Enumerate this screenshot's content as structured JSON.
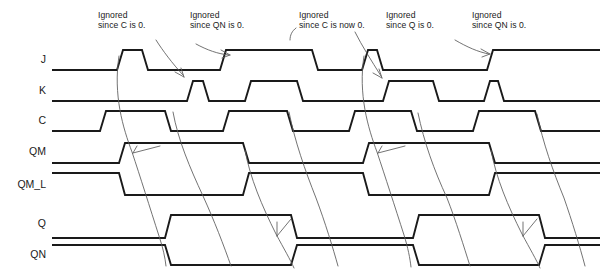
{
  "figure": {
    "type": "digital-timing-diagram",
    "title": "",
    "width": 604,
    "height": 272,
    "background_color": "#ffffff",
    "wave_color": "#1a1a1a",
    "leader_color": "#5a5a5a"
  },
  "signals": [
    {
      "name": "J",
      "label": "J"
    },
    {
      "name": "K",
      "label": "K"
    },
    {
      "name": "C",
      "label": "C"
    },
    {
      "name": "QM",
      "label": "QM"
    },
    {
      "name": "QM_L",
      "label": "QM_L"
    },
    {
      "name": "Q",
      "label": "Q"
    },
    {
      "name": "QN",
      "label": "QN"
    }
  ],
  "annotations": [
    {
      "name": "annotation-1",
      "line1": "Ignored",
      "line2": "since C is 0."
    },
    {
      "name": "annotation-2",
      "line1": "Ignored",
      "line2": "since QN is 0."
    },
    {
      "name": "annotation-3",
      "line1": "Ignored",
      "line2": "since C is now 0."
    },
    {
      "name": "annotation-4",
      "line1": "Ignored",
      "line2": "since Q is 0."
    },
    {
      "name": "annotation-5",
      "line1": "Ignored",
      "line2": "since QN is 0."
    }
  ],
  "chart_data": {
    "type": "line",
    "subtype": "timing-waveform",
    "xlabel": "time",
    "ylabel": "logic level",
    "xlim": [
      52,
      600
    ],
    "levels": {
      "low": 0,
      "high": 1
    },
    "series": [
      {
        "name": "J",
        "row_y_low": 70,
        "row_y_high": 50,
        "transitions": [
          {
            "x": 52,
            "level": 0
          },
          {
            "x": 120,
            "level": 1
          },
          {
            "x": 145,
            "level": 0
          },
          {
            "x": 223,
            "level": 1
          },
          {
            "x": 315,
            "level": 0
          },
          {
            "x": 365,
            "level": 1
          },
          {
            "x": 380,
            "level": 0
          },
          {
            "x": 490,
            "level": 1
          },
          {
            "x": 600,
            "level": 1
          }
        ]
      },
      {
        "name": "K",
        "row_y_low": 101,
        "row_y_high": 81,
        "transitions": [
          {
            "x": 52,
            "level": 0
          },
          {
            "x": 190,
            "level": 1
          },
          {
            "x": 206,
            "level": 0
          },
          {
            "x": 248,
            "level": 1
          },
          {
            "x": 300,
            "level": 0
          },
          {
            "x": 386,
            "level": 1
          },
          {
            "x": 436,
            "level": 0
          },
          {
            "x": 487,
            "level": 1
          },
          {
            "x": 501,
            "level": 0
          },
          {
            "x": 600,
            "level": 0
          }
        ]
      },
      {
        "name": "C",
        "row_y_low": 131,
        "row_y_high": 111,
        "transitions": [
          {
            "x": 52,
            "level": 0
          },
          {
            "x": 103,
            "level": 1
          },
          {
            "x": 168,
            "level": 0
          },
          {
            "x": 226,
            "level": 1
          },
          {
            "x": 290,
            "level": 0
          },
          {
            "x": 352,
            "level": 1
          },
          {
            "x": 414,
            "level": 0
          },
          {
            "x": 476,
            "level": 1
          },
          {
            "x": 538,
            "level": 0
          },
          {
            "x": 600,
            "level": 0
          }
        ]
      },
      {
        "name": "QM",
        "row_y_low": 163,
        "row_y_high": 143,
        "transitions": [
          {
            "x": 52,
            "level": 0
          },
          {
            "x": 122,
            "level": 1
          },
          {
            "x": 246,
            "level": 0
          },
          {
            "x": 366,
            "level": 1
          },
          {
            "x": 492,
            "level": 0
          },
          {
            "x": 600,
            "level": 0
          }
        ]
      },
      {
        "name": "QM_L",
        "row_y_low": 195,
        "row_y_high": 173,
        "transitions": [
          {
            "x": 52,
            "level": 1
          },
          {
            "x": 122,
            "level": 0
          },
          {
            "x": 246,
            "level": 1
          },
          {
            "x": 366,
            "level": 0
          },
          {
            "x": 492,
            "level": 1
          },
          {
            "x": 600,
            "level": 1
          }
        ]
      },
      {
        "name": "Q",
        "row_y_low": 238,
        "row_y_high": 215,
        "transitions": [
          {
            "x": 52,
            "level": 0
          },
          {
            "x": 168,
            "level": 1
          },
          {
            "x": 294,
            "level": 0
          },
          {
            "x": 416,
            "level": 1
          },
          {
            "x": 542,
            "level": 0
          },
          {
            "x": 600,
            "level": 0
          }
        ]
      },
      {
        "name": "QN",
        "row_y_low": 265,
        "row_y_high": 245,
        "transitions": [
          {
            "x": 52,
            "level": 1
          },
          {
            "x": 168,
            "level": 0
          },
          {
            "x": 294,
            "level": 1
          },
          {
            "x": 416,
            "level": 0
          },
          {
            "x": 542,
            "level": 1
          },
          {
            "x": 600,
            "level": 1
          }
        ]
      }
    ],
    "legend_position": "none",
    "grid": false
  }
}
